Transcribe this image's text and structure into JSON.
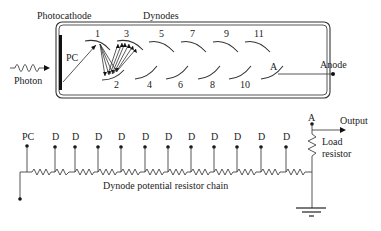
{
  "tube": {
    "photocathode_label": "Photocathode",
    "dynodes_label": "Dynodes",
    "photon_label": "Photon",
    "pc_label": "PC",
    "anode_label": "Anode",
    "anode_plate_label": "A",
    "dynodes": [
      {
        "n": "1",
        "x": 98,
        "y": 37,
        "row": "top"
      },
      {
        "n": "2",
        "x": 117,
        "y": 86,
        "row": "bottom"
      },
      {
        "n": "3",
        "x": 127,
        "y": 37,
        "row": "top"
      },
      {
        "n": "4",
        "x": 150,
        "y": 86,
        "row": "bottom"
      },
      {
        "n": "5",
        "x": 162,
        "y": 37,
        "row": "top"
      },
      {
        "n": "6",
        "x": 181,
        "y": 86,
        "row": "bottom"
      },
      {
        "n": "7",
        "x": 193,
        "y": 37,
        "row": "top"
      },
      {
        "n": "8",
        "x": 213,
        "y": 86,
        "row": "bottom"
      },
      {
        "n": "9",
        "x": 227,
        "y": 37,
        "row": "top"
      },
      {
        "n": "10",
        "x": 244,
        "y": 86,
        "row": "bottom"
      },
      {
        "n": "11",
        "x": 257,
        "y": 37,
        "row": "top"
      }
    ]
  },
  "circuit": {
    "pc_label": "PC",
    "tap_label": "D",
    "tap_count": 11,
    "anode_label": "A",
    "output_label": "Output",
    "load_resistor_label_line1": "Load",
    "load_resistor_label_line2": "resistor",
    "chain_label": "Dynode potential resistor chain"
  }
}
